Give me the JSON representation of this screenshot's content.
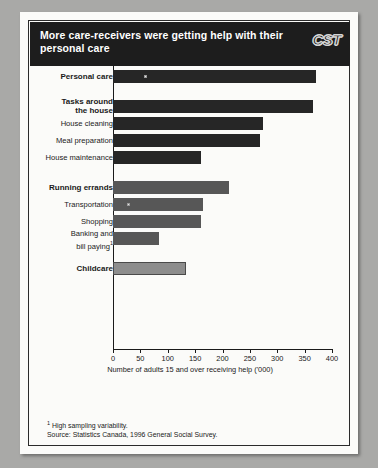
{
  "banner": {
    "title": "More care-receivers were getting\nhelp with their personal care",
    "logo": "CST"
  },
  "notes": {
    "footnote_marker": "1",
    "footnote": "High sampling variability.",
    "source": "Source: Statistics Canada, 1996 General Social Survey."
  },
  "colors": {
    "page": "#fbfbf9",
    "banner": "#1d1d1d",
    "bar_dark": "#262626",
    "bar_mid": "#575757",
    "bar_light": "#8d8d8d",
    "outer_background": "#a9a9a7"
  },
  "chart_data": {
    "type": "bar",
    "orientation": "horizontal",
    "title": "More care-receivers were getting help with their personal care",
    "xlabel": "Number of adults 15 and over receiving help ('000)",
    "ylabel": "",
    "xlim": [
      0,
      400
    ],
    "xticks": [
      0,
      50,
      100,
      150,
      200,
      250,
      300,
      350,
      400
    ],
    "grid": false,
    "legend": false,
    "categories": [
      "Personal care",
      "Tasks around\nthe house",
      "House cleaning",
      "Meal preparation",
      "House maintenance",
      "Running errands",
      "Transportation",
      "Shopping",
      "Banking and\nbill paying1",
      "Childcare"
    ],
    "values": [
      370,
      365,
      274,
      269,
      160,
      212,
      165,
      160,
      84,
      133
    ],
    "bars": [
      {
        "label": "Personal care",
        "value": 370,
        "bold": true,
        "shade": "dark",
        "marker": true,
        "gap_before": 0
      },
      {
        "label": "Tasks around\nthe house",
        "value": 365,
        "bold": true,
        "shade": "dark",
        "marker": false,
        "gap_before": 1
      },
      {
        "label": "House cleaning",
        "value": 274,
        "bold": false,
        "shade": "dark",
        "marker": false,
        "gap_before": 0
      },
      {
        "label": "Meal preparation",
        "value": 269,
        "bold": false,
        "shade": "dark",
        "marker": false,
        "gap_before": 0
      },
      {
        "label": "House maintenance",
        "value": 160,
        "bold": false,
        "shade": "dark",
        "marker": false,
        "gap_before": 0
      },
      {
        "label": "Running errands",
        "value": 212,
        "bold": true,
        "shade": "mid",
        "marker": false,
        "gap_before": 1
      },
      {
        "label": "Transportation",
        "value": 165,
        "bold": false,
        "shade": "mid",
        "marker": true,
        "gap_before": 0
      },
      {
        "label": "Shopping",
        "value": 160,
        "bold": false,
        "shade": "mid",
        "marker": false,
        "gap_before": 0
      },
      {
        "label": "Banking and\nbill paying1",
        "value": 84,
        "bold": false,
        "shade": "mid",
        "marker": false,
        "gap_before": 0
      },
      {
        "label": "Childcare",
        "value": 133,
        "bold": true,
        "shade": "light",
        "marker": false,
        "gap_before": 1
      }
    ]
  }
}
